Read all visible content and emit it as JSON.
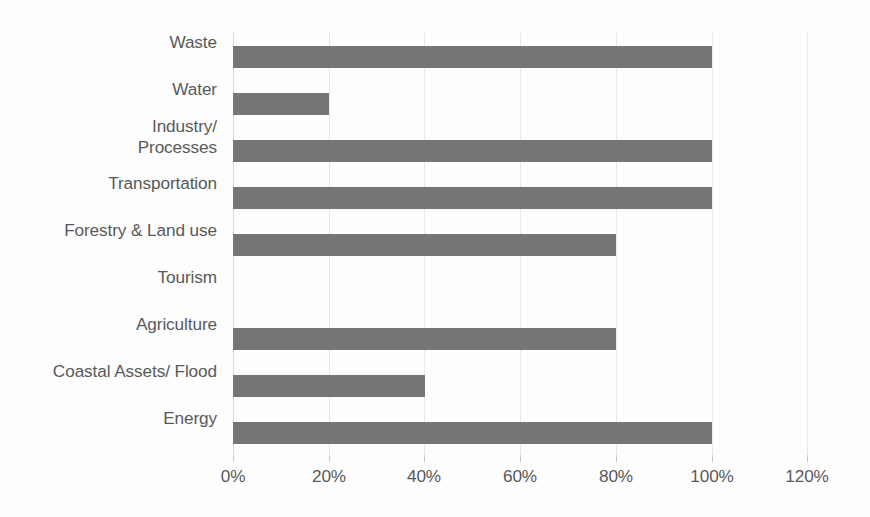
{
  "chart_data": {
    "type": "bar",
    "orientation": "horizontal",
    "title": "",
    "subtitle": "",
    "xlabel": "",
    "ylabel": "",
    "categories": [
      "Waste",
      "Water",
      "Industry/\nProcesses",
      "Transportation",
      "Forestry & Land use",
      "Tourism",
      "Agriculture",
      "Coastal Assets/ Flood",
      "Energy"
    ],
    "values": [
      100,
      20,
      100,
      100,
      80,
      0,
      80,
      40,
      100
    ],
    "value_suffix": "%",
    "xlim": [
      0,
      120
    ],
    "xticks": [
      0,
      20,
      40,
      60,
      80,
      100,
      120
    ],
    "xtick_labels": [
      "0%",
      "20%",
      "40%",
      "60%",
      "80%",
      "100%",
      "120%"
    ],
    "grid": true,
    "legend": "none",
    "series": [
      {
        "name": "",
        "values": [
          100,
          20,
          100,
          100,
          80,
          0,
          80,
          40,
          100
        ]
      }
    ]
  },
  "style": {
    "bar_color": "#757575",
    "text_color": "#595959",
    "gridline_color": "#e8e8e8",
    "axis_color": "#d9d9d9",
    "background_color": "#fdfdfd"
  }
}
